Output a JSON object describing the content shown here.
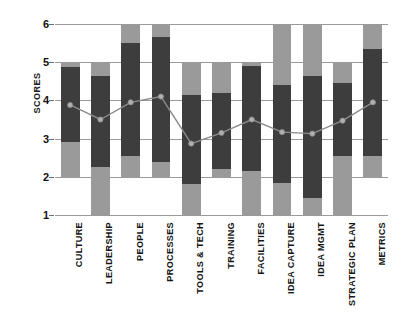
{
  "chart_data": {
    "type": "bar",
    "title": "",
    "subtitle": "",
    "xlabel": "",
    "ylabel": "SCORES",
    "ylim": [
      1,
      6
    ],
    "yticks": [
      1,
      2,
      3,
      4,
      5,
      6
    ],
    "grid": true,
    "legend": false,
    "legend_position": "none",
    "orientation": "vertical",
    "bar_style": "floating-range-bars-with-line-overlay",
    "colors": {
      "outer_range": "#9a9a9a",
      "inner_range": "#3d3d3d",
      "line": "#8a8a8a",
      "marker": "#b0b0b0",
      "gridline": "#9b9b9b",
      "text": "#141414",
      "background": "#ffffff"
    },
    "categories": [
      "CULTURE",
      "LEADERSHIP",
      "PEOPLE",
      "PROCESSES",
      "TOOLS & TECH",
      "TRAINING",
      "FACILITIES",
      "IDEA CAPTURE",
      "IDEA MGMT",
      "STRATEGIC PLAN",
      "METRICS"
    ],
    "series": [
      {
        "name": "Outer range (min-max)",
        "type": "range-bar",
        "color": "#9a9a9a",
        "low": [
          2.0,
          1.0,
          2.0,
          2.0,
          1.0,
          2.0,
          1.0,
          1.0,
          1.0,
          1.0,
          2.0
        ],
        "high": [
          5.0,
          5.0,
          6.0,
          6.0,
          5.0,
          5.0,
          5.0,
          6.0,
          6.0,
          5.0,
          6.0
        ]
      },
      {
        "name": "Inner range (quartiles)",
        "type": "range-bar",
        "color": "#3d3d3d",
        "low": [
          2.9,
          2.25,
          2.55,
          2.4,
          1.8,
          2.2,
          2.15,
          1.85,
          1.45,
          2.55,
          2.55
        ],
        "high": [
          4.87,
          4.65,
          5.5,
          5.65,
          4.15,
          4.2,
          4.9,
          4.4,
          4.65,
          4.45,
          5.35
        ]
      },
      {
        "name": "Mean score",
        "type": "line",
        "color": "#8a8a8a",
        "values": [
          3.88,
          3.5,
          3.95,
          4.1,
          2.87,
          3.15,
          3.5,
          3.17,
          3.13,
          3.47,
          3.95
        ]
      }
    ]
  }
}
